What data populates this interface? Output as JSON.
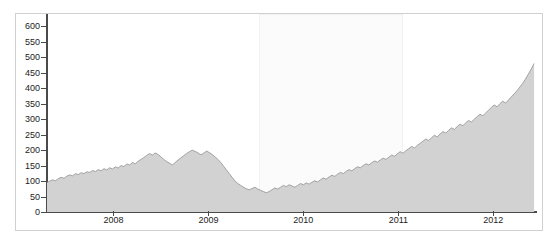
{
  "chart_data": {
    "type": "area",
    "title": "",
    "subtitle": "",
    "xlabel": "",
    "ylabel": "",
    "xlim": [
      2007.3,
      2012.45
    ],
    "ylim": [
      0,
      640
    ],
    "grid": false,
    "legend": null,
    "colors": {
      "area_fill": "#d2d2d2",
      "area_line": "#9a9a9a",
      "axis": "#4a4a4a",
      "frame": "#d0d0d0",
      "highlight": "#fbfbfb",
      "tick_text": "#1c1c1c",
      "background": "#ffffff"
    },
    "y_ticks": [
      0,
      50,
      100,
      150,
      200,
      250,
      300,
      350,
      400,
      450,
      500,
      550,
      600
    ],
    "y_tick_labels": [
      "0",
      "50",
      "100",
      "150",
      "200",
      "250",
      "300",
      "350",
      "400",
      "450",
      "500",
      "550",
      "600"
    ],
    "x_ticks": [
      2008,
      2009,
      2010,
      2011,
      2012
    ],
    "x_tick_labels": [
      "2008",
      "2009",
      "2010",
      "2011",
      "2012"
    ],
    "annotations": [
      {
        "name": "highlight-band",
        "type": "vspan",
        "x_start": 2009.53,
        "x_end": 2011.05
      }
    ],
    "x": [
      2007.3,
      2007.33,
      2007.36,
      2007.39,
      2007.42,
      2007.45,
      2007.48,
      2007.51,
      2007.54,
      2007.57,
      2007.6,
      2007.63,
      2007.66,
      2007.69,
      2007.72,
      2007.75,
      2007.78,
      2007.81,
      2007.84,
      2007.87,
      2007.9,
      2007.93,
      2007.96,
      2007.99,
      2008.02,
      2008.05,
      2008.08,
      2008.11,
      2008.14,
      2008.17,
      2008.2,
      2008.23,
      2008.26,
      2008.29,
      2008.32,
      2008.35,
      2008.38,
      2008.41,
      2008.44,
      2008.47,
      2008.5,
      2008.53,
      2008.56,
      2008.59,
      2008.62,
      2008.65,
      2008.68,
      2008.71,
      2008.74,
      2008.77,
      2008.8,
      2008.83,
      2008.86,
      2008.89,
      2008.92,
      2008.95,
      2008.98,
      2009.01,
      2009.04,
      2009.07,
      2009.1,
      2009.13,
      2009.16,
      2009.19,
      2009.22,
      2009.25,
      2009.28,
      2009.31,
      2009.34,
      2009.37,
      2009.4,
      2009.43,
      2009.46,
      2009.49,
      2009.52,
      2009.55,
      2009.58,
      2009.61,
      2009.64,
      2009.67,
      2009.7,
      2009.73,
      2009.76,
      2009.79,
      2009.82,
      2009.85,
      2009.88,
      2009.91,
      2009.94,
      2009.97,
      2010.0,
      2010.03,
      2010.06,
      2010.09,
      2010.12,
      2010.15,
      2010.18,
      2010.21,
      2010.24,
      2010.27,
      2010.3,
      2010.33,
      2010.36,
      2010.39,
      2010.42,
      2010.45,
      2010.48,
      2010.51,
      2010.54,
      2010.57,
      2010.6,
      2010.63,
      2010.66,
      2010.69,
      2010.72,
      2010.75,
      2010.78,
      2010.81,
      2010.84,
      2010.87,
      2010.9,
      2010.93,
      2010.96,
      2010.99,
      2011.02,
      2011.05,
      2011.08,
      2011.11,
      2011.14,
      2011.17,
      2011.2,
      2011.23,
      2011.26,
      2011.29,
      2011.32,
      2011.35,
      2011.38,
      2011.41,
      2011.44,
      2011.47,
      2011.5,
      2011.53,
      2011.56,
      2011.59,
      2011.62,
      2011.65,
      2011.68,
      2011.71,
      2011.74,
      2011.77,
      2011.8,
      2011.83,
      2011.86,
      2011.89,
      2011.92,
      2011.95,
      2011.98,
      2012.01,
      2012.04,
      2012.07,
      2012.1,
      2012.13,
      2012.16,
      2012.19,
      2012.22,
      2012.25,
      2012.28,
      2012.31,
      2012.34,
      2012.37,
      2012.4,
      2012.43
    ],
    "y": [
      95,
      100,
      104,
      101,
      108,
      112,
      109,
      116,
      120,
      117,
      124,
      121,
      127,
      124,
      130,
      128,
      134,
      131,
      137,
      133,
      140,
      136,
      143,
      139,
      146,
      142,
      150,
      147,
      155,
      152,
      160,
      156,
      164,
      170,
      176,
      183,
      189,
      184,
      191,
      186,
      178,
      170,
      163,
      158,
      152,
      160,
      168,
      175,
      182,
      189,
      195,
      200,
      196,
      191,
      185,
      190,
      197,
      192,
      186,
      178,
      170,
      160,
      148,
      136,
      124,
      112,
      100,
      92,
      86,
      80,
      75,
      72,
      76,
      80,
      74,
      70,
      66,
      62,
      66,
      72,
      78,
      74,
      80,
      86,
      82,
      88,
      84,
      80,
      86,
      92,
      88,
      94,
      90,
      96,
      101,
      97,
      104,
      110,
      106,
      113,
      119,
      115,
      122,
      128,
      124,
      131,
      137,
      133,
      140,
      146,
      143,
      150,
      156,
      152,
      159,
      165,
      161,
      168,
      174,
      170,
      177,
      184,
      180,
      188,
      195,
      190,
      198,
      205,
      212,
      207,
      215,
      222,
      229,
      236,
      231,
      240,
      248,
      243,
      252,
      260,
      255,
      264,
      272,
      267,
      276,
      284,
      279,
      288,
      296,
      291,
      300,
      308,
      316,
      311,
      320,
      329,
      338,
      346,
      340,
      350,
      358,
      352,
      362,
      372,
      382,
      392,
      404,
      416,
      430,
      446,
      462,
      480
    ],
    "series_note": "Indexed price level, monthly-resolution grayscale area series"
  }
}
